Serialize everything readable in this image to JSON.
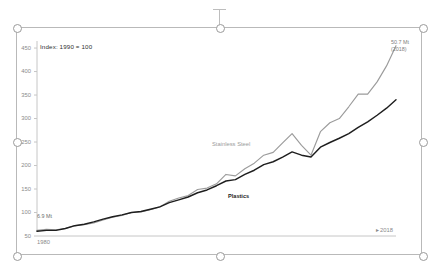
{
  "selection": {
    "name": "chart-object-selection",
    "handles": [
      "top-left",
      "top-center",
      "top-right",
      "middle-left",
      "middle-right",
      "bottom-left",
      "bottom-center",
      "bottom-right"
    ],
    "rotation_handle": "rotate-handle",
    "frame_color": "#b9b9b9",
    "handle_color": "#9a9a9a"
  },
  "chart_data": {
    "type": "line",
    "title": "",
    "subtitle": "",
    "header_note": "Index: 1990 = 100",
    "xlabel": "",
    "ylabel": "",
    "xlim": [
      1980,
      2018
    ],
    "ylim": [
      50,
      465
    ],
    "yticks": [
      50,
      100,
      150,
      200,
      250,
      300,
      350,
      400,
      450
    ],
    "ytick_labels": [
      "50",
      "100",
      "150",
      "200",
      "250",
      "300",
      "350",
      "400",
      "450"
    ],
    "xticks": [
      1980,
      2018
    ],
    "xtick_labels": [
      "1980",
      "2018"
    ],
    "x_axis_end_arrow": "▸",
    "grid": false,
    "legend": "inline-labels",
    "x": [
      1980,
      1981,
      1982,
      1983,
      1984,
      1985,
      1986,
      1987,
      1988,
      1989,
      1990,
      1991,
      1992,
      1993,
      1994,
      1995,
      1996,
      1997,
      1998,
      1999,
      2000,
      2001,
      2002,
      2003,
      2004,
      2005,
      2006,
      2007,
      2008,
      2009,
      2010,
      2011,
      2012,
      2013,
      2014,
      2015,
      2016,
      2017,
      2018
    ],
    "series": [
      {
        "name": "Stainless Steel",
        "color": "#9b9b9b",
        "label_position": "inline",
        "values": [
          62,
          64,
          63,
          66,
          72,
          74,
          78,
          84,
          90,
          94,
          100,
          101,
          106,
          112,
          124,
          131,
          136,
          149,
          152,
          161,
          181,
          178,
          193,
          205,
          222,
          228,
          248,
          268,
          243,
          222,
          272,
          291,
          300,
          325,
          352,
          352,
          378,
          412,
          455
        ]
      },
      {
        "name": "Plastics",
        "color": "#1e1e1e",
        "label_position": "inline",
        "values": [
          60,
          62,
          62,
          66,
          72,
          75,
          80,
          86,
          91,
          95,
          100,
          102,
          107,
          112,
          121,
          127,
          133,
          142,
          148,
          157,
          167,
          170,
          181,
          190,
          202,
          208,
          218,
          229,
          222,
          218,
          239,
          249,
          258,
          268,
          281,
          293,
          307,
          322,
          340
        ]
      }
    ],
    "annotations": [
      {
        "name": "start-value-annotation",
        "text": "6.9 Mt",
        "at_year": 1980
      },
      {
        "name": "end-value-annotation",
        "line1": "50.7 Mt",
        "line2": "(2018)",
        "at_year": 2018
      }
    ]
  }
}
